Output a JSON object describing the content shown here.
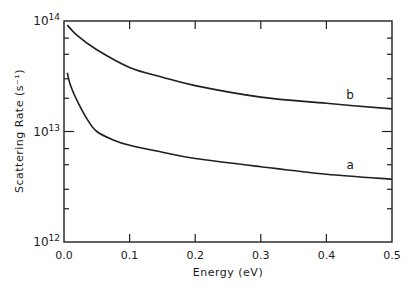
{
  "chart_data": {
    "type": "line",
    "title": "",
    "xlabel": "Energy (eV)",
    "ylabel": "Scattering Rate (s⁻¹)",
    "xlim": [
      0.0,
      0.5
    ],
    "ylim": [
      1000000000000.0,
      100000000000000.0
    ],
    "yscale": "log",
    "grid": false,
    "legend": "none (inline curve labels)",
    "x_ticks": [
      "0.0",
      "0.1",
      "0.2",
      "0.3",
      "0.4",
      "0.5"
    ],
    "y_ticks": [
      {
        "base": "10",
        "exp": "14",
        "value": 100000000000000.0
      },
      {
        "base": "10",
        "exp": "13",
        "value": 10000000000000.0
      },
      {
        "base": "10",
        "exp": "12",
        "value": 1000000000000.0
      }
    ],
    "series": [
      {
        "name": "b",
        "x": [
          0.005,
          0.02,
          0.05,
          0.1,
          0.15,
          0.2,
          0.3,
          0.4,
          0.5
        ],
        "values": [
          92000000000000.0,
          74000000000000.0,
          55000000000000.0,
          38000000000000.0,
          31000000000000.0,
          26000000000000.0,
          20500000000000.0,
          18000000000000.0,
          16000000000000.0
        ],
        "label_pos": {
          "x": 0.43,
          "y": 19500000000000.0
        }
      },
      {
        "name": "a",
        "x": [
          0.005,
          0.01,
          0.02,
          0.035,
          0.05,
          0.075,
          0.1,
          0.15,
          0.2,
          0.3,
          0.4,
          0.5
        ],
        "values": [
          34000000000000.0,
          26000000000000.0,
          19000000000000.0,
          13000000000000.0,
          10000000000000.0,
          8400000000000.0,
          7500000000000.0,
          6500000000000.0,
          5700000000000.0,
          4800000000000.0,
          4100000000000.0,
          3700000000000.0
        ],
        "label_pos": {
          "x": 0.43,
          "y": 4600000000000.0
        }
      }
    ]
  }
}
